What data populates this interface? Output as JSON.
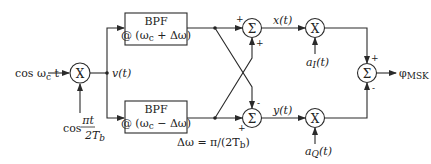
{
  "diagram": {
    "inputs": {
      "carrier": "cos ωc t",
      "carrier_parts": {
        "prefix": "cos ω",
        "sub": "c",
        "suffix": " t"
      },
      "modulating": {
        "prefix": "cos",
        "numerator": "πt",
        "denominator": "2T",
        "denominator_sub": "b"
      }
    },
    "nodes": {
      "multiplier_symbol": "X",
      "summer_symbol": "Σ",
      "mixer_output": "v(t)"
    },
    "filters": [
      {
        "label": "BPF",
        "center": "@ (ωc + Δω)",
        "center_parts": {
          "pre": "@ (ω",
          "sub": "c",
          "post": " + Δω)"
        }
      },
      {
        "label": "BPF",
        "center": "@ (ωc − Δω)",
        "center_parts": {
          "pre": "@ (ω",
          "sub": "c",
          "post": " − Δω)"
        }
      }
    ],
    "delta_omega": {
      "pre": "Δω = π/(2T",
      "sub": "b",
      "post": ")"
    },
    "summers": {
      "top": {
        "in_left_sign": "+",
        "in_bottom_sign": "+",
        "output": "x(t)"
      },
      "bottom": {
        "in_left_sign": "+",
        "in_top_sign": "-",
        "output": "y(t)"
      },
      "final": {
        "in_top_sign": "+",
        "in_bottom_sign": "-"
      }
    },
    "data_signals": {
      "in_phase": {
        "pre": "a",
        "sub": "I",
        "post": "(t)"
      },
      "quadrature": {
        "pre": "a",
        "sub": "Q",
        "post": "(t)"
      }
    },
    "output": {
      "pre": "φ",
      "sub": "MSK"
    }
  }
}
